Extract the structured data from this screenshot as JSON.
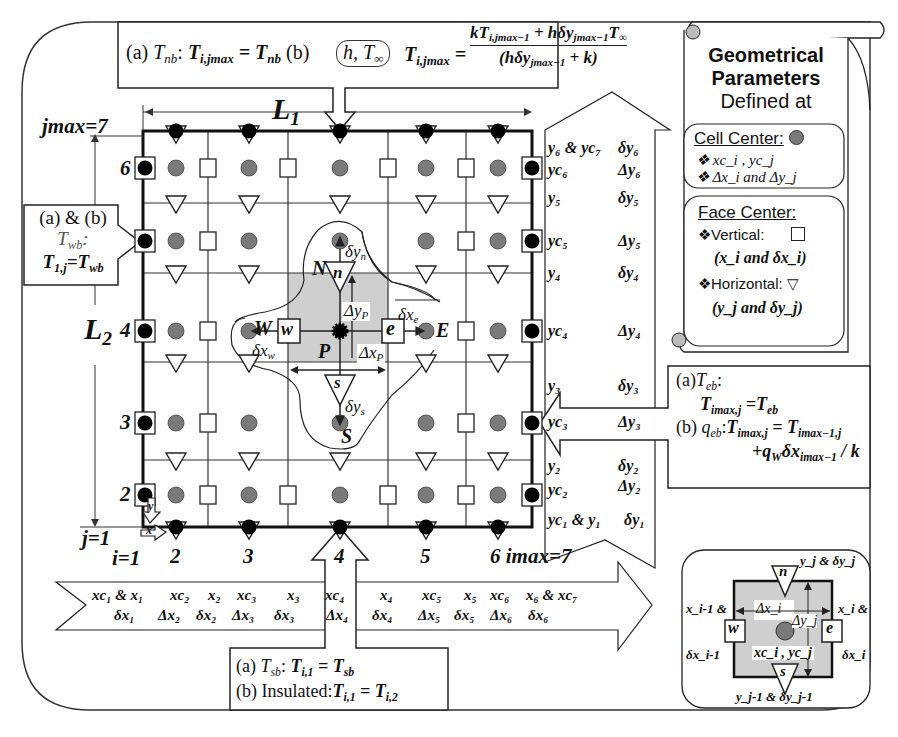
{
  "colors": {
    "cell_center": "#7a7a7a",
    "boundary_node": "#000000",
    "control_volume": "#d0d0d0",
    "line": "#222222"
  },
  "north_boundary": {
    "a_label": "(a) ",
    "a_var": "T",
    "a_var_sub": "nb",
    "a_eq_lhs": "T",
    "a_eq_lhs_sub": "i,jmax",
    "a_eq_rhs": " = T",
    "a_eq_rhs_sub": "nb",
    "b_label": " (b)",
    "cloud_text": "h, T",
    "cloud_sub": "∞",
    "b_lhs": "T",
    "b_lhs_sub": "i,jmax",
    "b_numerator": "kT",
    "b_numerator_sub1": "i,jmax−1",
    "b_numerator_mid": " + hδy",
    "b_numerator_sub2": "jmax−1",
    "b_numerator_end": "T",
    "b_numerator_sub3": "∞",
    "b_denominator": "(hδy",
    "b_denominator_sub": "jmax−1",
    "b_denominator_end": " + k)"
  },
  "west_boundary": {
    "line1": "(a) & (b)",
    "line2": "T",
    "line2_sub": "wb",
    "line3_lhs": "T",
    "line3_lhs_sub": "1,j",
    "line3_rhs": "=T",
    "line3_rhs_sub": "wb"
  },
  "east_boundary": {
    "a_label": "(a)",
    "a_var": "T",
    "a_var_sub": "eb",
    "a_eq": "T",
    "a_eq_sub": "imax,j",
    "a_eq_rhs": " =T",
    "a_eq_rhs_sub": "eb",
    "b_label": "(b) ",
    "b_var": "q",
    "b_var_sub": "eb",
    "b_lhs": "T",
    "b_lhs_sub": "imax,j",
    "b_rhs": " = T",
    "b_rhs_sub": "imax−1,j",
    "b_line2": "+q",
    "b_line2_sub": "W",
    "b_line2_mid": "δx",
    "b_line2_sub2": "imax−1",
    "b_line2_end": " / k"
  },
  "south_boundary": {
    "a_label": "(a) ",
    "a_var": "T",
    "a_var_sub": "sb",
    "a_lhs": "T",
    "a_lhs_sub": "i,1",
    "a_rhs": " = T",
    "a_rhs_sub": "sb",
    "b_label": "(b) Insulated:",
    "b_lhs": "T",
    "b_lhs_sub": "i,1",
    "b_rhs": " = T",
    "b_rhs_sub": "i,2"
  },
  "legend": {
    "title1": "Geometrical",
    "title2": "Parameters",
    "title3": "Defined at",
    "cell_center_heading": "Cell Center:",
    "cell_items": [
      "xc_i , yc_j",
      "Δx_i and Δy_j"
    ],
    "face_center_heading": "Face Center:",
    "vertical_label": "❖Vertical:",
    "vertical_desc": "(x_i and δx_i)",
    "horizontal_label": "❖Horizontal:",
    "horizontal_desc": "(y_j and δy_j)",
    "bullet": "❖"
  },
  "grid": {
    "jmax_label": "jmax=7",
    "imax_label": "6 imax=7",
    "j1_label": "j=1",
    "i1_label": "i=1",
    "L1": "L",
    "L1_sub": "1",
    "L2": "L",
    "L2_sub": "2",
    "row_labels": [
      "6",
      "4",
      "3",
      "2"
    ],
    "col_labels": [
      "2",
      "3",
      "4",
      "5"
    ],
    "x_arrow": "x",
    "y_arrow": "y"
  },
  "stencil": {
    "P": "P",
    "N": "N",
    "S": "S",
    "E": "E",
    "W": "W",
    "n": "n",
    "s": "s",
    "e": "e",
    "w": "w",
    "dyn": "δy",
    "dyn_sub": "n",
    "dys": "δy",
    "dys_sub": "s",
    "dxe": "δx",
    "dxe_sub": "e",
    "dxw": "δx",
    "dxw_sub": "w",
    "DyP": "Δy",
    "DyP_sub": "P",
    "DxP": "Δx",
    "DxP_sub": "P"
  },
  "y_params": [
    {
      "left": "y₆ & yc₇",
      "right": "δy₆"
    },
    {
      "left": "yc₆",
      "right": "Δy₆"
    },
    {
      "left": "y₅",
      "right": "δy₅"
    },
    {
      "left": "yc₅",
      "right": "Δy₅"
    },
    {
      "left": "y₄",
      "right": "δy₄"
    },
    {
      "left": "yc₄",
      "right": "Δy₄"
    },
    {
      "left": "y₃",
      "right": "δy₃"
    },
    {
      "left": "yc₃",
      "right": "Δy₃"
    },
    {
      "left": "y₂",
      "right": "δy₂"
    },
    {
      "left": "yc₂",
      "right": "Δy₂"
    },
    {
      "left": "yc₁ & y₁",
      "right": "δy₁"
    }
  ],
  "x_params": {
    "row1": [
      "xc₁ & x₁",
      "xc₂",
      "x₂",
      "xc₃",
      "x₃",
      "xc₄",
      "x₄",
      "xc₅",
      "x₅",
      "xc₆",
      "x₆ & xc₇"
    ],
    "row2": [
      "δx₁",
      "Δx₂",
      "δx₂",
      "Δx₃",
      "δx₃",
      "Δx₄",
      "δx₄",
      "Δx₅",
      "δx₅",
      "Δx₆",
      "δx₆"
    ]
  },
  "cell_detail": {
    "n": "n",
    "s": "s",
    "e": "e",
    "w": "w",
    "top": "y_j & δy_j",
    "bottom": "y_j-1 & δy_j-1",
    "left1": "x_i-1 &",
    "left2": "δx_i-1",
    "right1": "x_i &",
    "right2": "δx_i",
    "dx": "Δx_i",
    "dy": "Δy_j",
    "center": "xc_i , yc_j"
  }
}
